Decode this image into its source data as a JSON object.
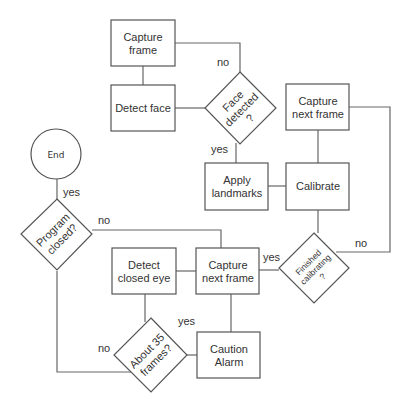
{
  "diagram": {
    "type": "flowchart",
    "nodes": {
      "capture_frame": {
        "shape": "rectangle",
        "lines": [
          "Capture",
          "frame"
        ]
      },
      "detect_face": {
        "shape": "rectangle",
        "lines": [
          "Detect face"
        ]
      },
      "face_detected": {
        "shape": "diamond",
        "lines": [
          "Face",
          "detected",
          "?"
        ]
      },
      "capture_next_frame_top": {
        "shape": "rectangle",
        "lines": [
          "Capture",
          "next frame"
        ]
      },
      "apply_landmarks": {
        "shape": "rectangle",
        "lines": [
          "Apply",
          "landmarks"
        ]
      },
      "calibrate": {
        "shape": "rectangle",
        "lines": [
          "Calibrate"
        ]
      },
      "end": {
        "shape": "circle",
        "lines": [
          "End"
        ]
      },
      "program_closed": {
        "shape": "diamond",
        "lines": [
          "Program",
          "closed?"
        ]
      },
      "detect_closed_eye": {
        "shape": "rectangle",
        "lines": [
          "Detect",
          "closed eye"
        ]
      },
      "capture_next_frame_main": {
        "shape": "rectangle",
        "lines": [
          "Capture",
          "next frame"
        ]
      },
      "finished_calibrating": {
        "shape": "diamond",
        "lines": [
          "Finished",
          "calibrating",
          "?"
        ]
      },
      "about_35_frames": {
        "shape": "diamond",
        "lines": [
          "About 35",
          "frames?"
        ]
      },
      "caution_alarm": {
        "shape": "rectangle",
        "lines": [
          "Caution",
          "Alarm"
        ]
      }
    },
    "edges": [
      {
        "from": "capture_frame",
        "to": "detect_face",
        "label": ""
      },
      {
        "from": "detect_face",
        "to": "face_detected",
        "label": ""
      },
      {
        "from": "face_detected",
        "to": "capture_frame",
        "label": "no"
      },
      {
        "from": "face_detected",
        "to": "apply_landmarks",
        "label": "yes"
      },
      {
        "from": "apply_landmarks",
        "to": "calibrate",
        "label": ""
      },
      {
        "from": "capture_next_frame_top",
        "to": "calibrate",
        "label": ""
      },
      {
        "from": "calibrate",
        "to": "finished_calibrating",
        "label": ""
      },
      {
        "from": "finished_calibrating",
        "to": "capture_next_frame_top",
        "label": "no"
      },
      {
        "from": "finished_calibrating",
        "to": "capture_next_frame_main",
        "label": "yes"
      },
      {
        "from": "capture_next_frame_main",
        "to": "detect_closed_eye",
        "label": ""
      },
      {
        "from": "capture_next_frame_main",
        "to": "caution_alarm",
        "label": ""
      },
      {
        "from": "detect_closed_eye",
        "to": "about_35_frames",
        "label": ""
      },
      {
        "from": "about_35_frames",
        "to": "caution_alarm",
        "label": "yes"
      },
      {
        "from": "about_35_frames",
        "to": "program_closed",
        "label": "no"
      },
      {
        "from": "program_closed",
        "to": "capture_next_frame_main",
        "label": "no"
      },
      {
        "from": "program_closed",
        "to": "end",
        "label": "yes"
      }
    ],
    "edge_labels": {
      "face_detected_no": "no",
      "face_detected_yes": "yes",
      "finished_calibrating_no": "no",
      "finished_calibrating_yes": "yes",
      "program_closed_no": "no",
      "program_closed_yes": "yes",
      "about_35_frames_no": "no",
      "about_35_frames_yes": "yes"
    }
  }
}
